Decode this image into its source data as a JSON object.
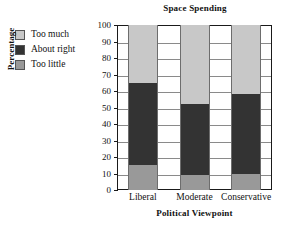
{
  "chart_data": {
    "type": "bar",
    "subtype": "stacked-bar",
    "title": "Space Spending",
    "xlabel": "Political Viewpoint",
    "ylabel": "Percentage",
    "categories": [
      "Liberal",
      "Moderate",
      "Conservative"
    ],
    "series": [
      {
        "name": "Too little",
        "values": [
          15,
          9,
          10
        ],
        "color": "#999999"
      },
      {
        "name": "About right",
        "values": [
          50,
          43,
          48
        ],
        "color": "#333333"
      },
      {
        "name": "Too much",
        "values": [
          35,
          48,
          42
        ],
        "color": "#c8c8c8"
      }
    ],
    "stack_order_bottom_to_top": [
      "Too little",
      "About right",
      "Too much"
    ],
    "cumulative_tops": {
      "Liberal": {
        "Too little": 15,
        "About right": 65,
        "Too much": 100
      },
      "Moderate": {
        "Too little": 9,
        "About right": 52,
        "Too much": 100
      },
      "Conservative": {
        "Too little": 10,
        "About right": 58,
        "Too much": 100
      }
    },
    "ylim": [
      0,
      100
    ],
    "ytick_values": [
      0,
      10,
      20,
      30,
      40,
      50,
      60,
      70,
      80,
      90,
      100
    ],
    "ytick_labels": [
      "0",
      "10",
      "20",
      "30",
      "40",
      "50",
      "60",
      "70",
      "80",
      "90",
      "100"
    ],
    "grid": "horizontal",
    "legend_position": "outside-top-left",
    "legend_entries": [
      {
        "label": "Too much",
        "color": "#c8c8c8"
      },
      {
        "label": "About right",
        "color": "#333333"
      },
      {
        "label": "Too little",
        "color": "#999999"
      }
    ]
  },
  "colors": {
    "too_much": "#c8c8c8",
    "about_right": "#333333",
    "too_little": "#999999",
    "axis": "#1a1a1a",
    "gridline": "#8a8a8a",
    "background": "#ffffff"
  }
}
